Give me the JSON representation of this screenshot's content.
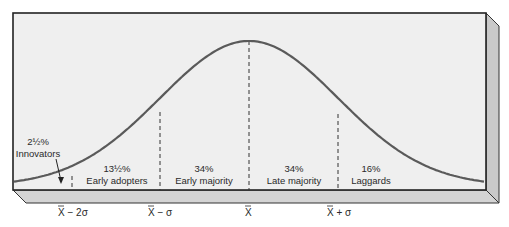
{
  "chart_data": {
    "type": "line",
    "title": "",
    "xlabel": "",
    "ylabel": "",
    "grid": false,
    "legend": "none",
    "x_ticks": [
      "X̄ − 2σ",
      "X̄ − σ",
      "X̄",
      "X̄ + σ"
    ],
    "x_tick_positions_sigma": [
      -2,
      -1,
      0,
      1
    ],
    "xlim_sigma": [
      -3,
      3
    ],
    "segments": [
      {
        "label": "Innovators",
        "percent": "2½%",
        "value": 2.5,
        "range_sigma": [
          -3,
          -2
        ]
      },
      {
        "label": "Early adopters",
        "percent": "13½%",
        "value": 13.5,
        "range_sigma": [
          -2,
          -1
        ]
      },
      {
        "label": "Early majority",
        "percent": "34%",
        "value": 34,
        "range_sigma": [
          -1,
          0
        ]
      },
      {
        "label": "Late majority",
        "percent": "34%",
        "value": 34,
        "range_sigma": [
          0,
          1
        ]
      },
      {
        "label": "Laggards",
        "percent": "16%",
        "value": 16,
        "range_sigma": [
          1,
          3
        ]
      }
    ],
    "annotations": [
      {
        "text": "2½% Innovators",
        "arrow_to": "area left of X̄ − 2σ"
      }
    ]
  },
  "labels": {
    "innovators_pct": "2½%",
    "innovators": "Innovators",
    "early_adopters_pct": "13½%",
    "early_adopters": "Early adopters",
    "early_majority_pct": "34%",
    "early_majority": "Early majority",
    "late_majority_pct": "34%",
    "late_majority": "Late majority",
    "laggards_pct": "16%",
    "laggards": "Laggards",
    "tick_minus2": "X − 2σ",
    "tick_minus1": "X − σ",
    "tick_mean": "X",
    "tick_plus1": "X + σ"
  },
  "colors": {
    "front_face": "#efefef",
    "side_face": "#c9c9c9",
    "bottom_face": "#d4d4d4",
    "curve": "#5a5a5a",
    "outline": "#222222",
    "text": "#2a2a2a"
  }
}
